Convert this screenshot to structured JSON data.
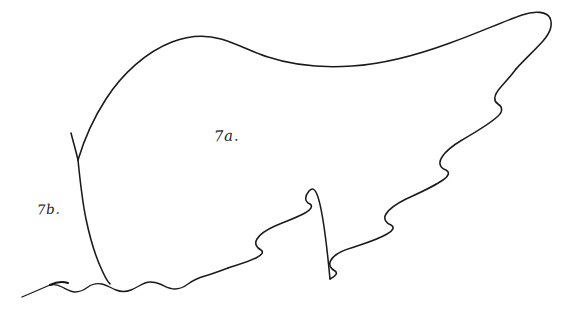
{
  "figure": {
    "title": "",
    "background_color": "#ffffff",
    "ink_color": "#1a1a1a",
    "labels": [
      {
        "id": "7a",
        "text": "7a.",
        "x": 214,
        "y": 127
      },
      {
        "id": "7b",
        "text": "7b.",
        "x": 37,
        "y": 201
      }
    ],
    "regions": [
      {
        "name": "upper-main-region",
        "label": "7a."
      },
      {
        "name": "lower-left-lobe-region",
        "label": "7b."
      }
    ],
    "strokes": {
      "upper_smooth_edge": "M 78 160 C 86 136 98 110 116 86 C 138 57 168 40 196 36 C 216 33 232 38 246 45 C 268 56 290 64 320 66 C 360 68 404 58 440 44 C 470 33 498 22 522 16 C 536 13 546 14 549 19",
      "right_tip_hook": "M 549 19 C 552 25 548 33 540 41 C 532 49 522 57 514 65",
      "scalloped_lower_right_edge": "M 514 65 C 508 72 500 78 495 84 C 489 91 489 97 494 100 C 498 103 499 108 494 113 C 486 120 474 128 463 135 C 452 142 443 148 439 152 C 434 157 435 162 440 165 C 444 167 444 171 439 175 C 430 181 416 187 404 192 C 393 197 385 202 382 206 C 379 210 381 214 386 216 C 390 218 389 222 384 225 C 375 230 362 234 351 237 C 341 240 334 243 331 247 C 328 251 330 255 334 257 C 337 259 336 262 331 265 C 323 269 311 272 301 274",
      "mid_scalloped_edge": "M 301 274 C 294 176 288 182 284 187 C 280 192 281 196 285 198 C 288 200 287 203 282 206 C 275 210 265 213 257 216 C 249 219 243 222 240 226 C 237 230 239 233 243 235 C 246 237 245 240 240 243 C 233 247 223 250 215 253",
      "bottom_wavelets": "M 48 282 C 56 279 64 277 72 279 C 80 281 86 286 94 287 C 102 288 110 284 118 283 C 126 282 133 286 141 287 C 149 288 157 284 165 283",
      "dividing_line_7b": "M 78 160 C 80 182 83 206 88 228 C 93 250 99 268 105 278 L 48 282",
      "notch_left_tick": "M 70 138 L 78 160",
      "left_tail": "M 48 282 L 22 296"
    }
  },
  "colors": {
    "background": "#ffffff",
    "ink": "#1a1a1a"
  }
}
